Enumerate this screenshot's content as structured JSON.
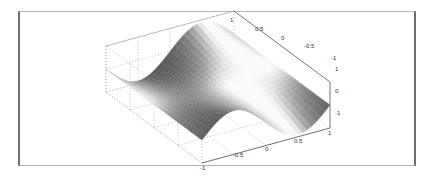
{
  "chart_data": {
    "type": "surface",
    "title": "",
    "xlabel": "",
    "ylabel": "",
    "zlabel": "",
    "colormap": "gray",
    "grid": true,
    "x_ticks": [
      "-1",
      "-0.5",
      "0",
      "0.5",
      "1"
    ],
    "y_ticks": [
      "1",
      "0.5",
      "0",
      "-0.5",
      "-1"
    ],
    "z_ticks": [
      "1",
      "0",
      "-1"
    ],
    "xlim": [
      -1,
      1
    ],
    "ylim": [
      -1,
      1
    ],
    "zlim": [
      -1,
      1
    ],
    "function": "z = sin(pi*x) * y (saddle-like wave surface)",
    "x": [
      -1,
      -0.5,
      0,
      0.5,
      1
    ],
    "y": [
      -1,
      -0.5,
      0,
      0.5,
      1
    ],
    "z": [
      [
        0,
        1,
        0,
        -1,
        0
      ],
      [
        0,
        0.5,
        0,
        -0.5,
        0
      ],
      [
        0,
        0,
        0,
        0,
        0
      ],
      [
        0,
        -0.5,
        0,
        0.5,
        0
      ],
      [
        0,
        -1,
        0,
        1,
        0
      ]
    ]
  },
  "labels": {
    "x_ticks": [
      "-1",
      "-0.5",
      "0",
      "0.5",
      "1"
    ],
    "y_ticks": [
      "1",
      "0.5",
      "0",
      "-0.5",
      "-1"
    ],
    "z_ticks": [
      "1",
      "0",
      "-1"
    ]
  }
}
